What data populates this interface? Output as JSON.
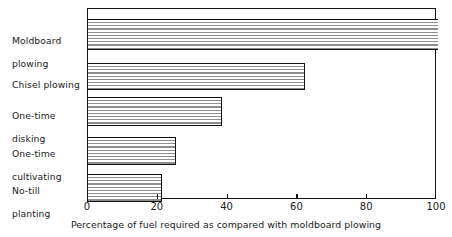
{
  "chart_data": {
    "type": "bar",
    "orientation": "horizontal",
    "title": "",
    "xlabel": "Percentage of fuel required as compared with moldboard plowing",
    "ylabel": "",
    "xlim": [
      0,
      100
    ],
    "xticks": [
      0,
      20,
      40,
      60,
      80,
      100
    ],
    "xticklabels": [
      "0",
      "20",
      "40",
      "60",
      "80",
      "100"
    ],
    "grid": false,
    "legend": null,
    "categories": [
      "Moldboard plowing",
      "Chisel plowing",
      "One-time disking",
      "One-time cultivating",
      "No-till planting"
    ],
    "values": [
      100,
      62,
      38,
      25,
      21
    ],
    "bars": [
      {
        "label_line1": "Moldboard",
        "label_line2": "plowing",
        "value": 100
      },
      {
        "label_line1": "Chisel plowing",
        "label_line2": "",
        "value": 62
      },
      {
        "label_line1": "One-time",
        "label_line2": "disking",
        "value": 38
      },
      {
        "label_line1": "One-time",
        "label_line2": "cultivating",
        "value": 25
      },
      {
        "label_line1": "No-till",
        "label_line2": "planting",
        "value": 21
      }
    ],
    "style": {
      "bar_fill": "#ffffff",
      "bar_hatch": "horizontal-lines",
      "bar_hatch_color": "#8d8d8d",
      "bar_edge_color": "#111111",
      "frame_color": "#111111",
      "background": "#ffffff",
      "text_color": "#1a1a1a"
    }
  },
  "labels": {
    "cat0_line1": "Moldboard",
    "cat0_line2": "plowing",
    "cat1_line1": "Chisel plowing",
    "cat1_line2": "",
    "cat2_line1": "One-time",
    "cat2_line2": "disking",
    "cat3_line1": "One-time",
    "cat3_line2": "cultivating",
    "cat4_line1": "No-till",
    "cat4_line2": "planting"
  },
  "axis": {
    "tick0": "0",
    "tick1": "20",
    "tick2": "40",
    "tick3": "60",
    "tick4": "80",
    "tick5": "100",
    "xlabel": "Percentage of fuel required as compared with moldboard plowing"
  }
}
